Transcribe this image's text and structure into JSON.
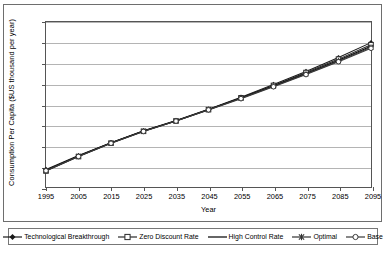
{
  "chart_data": {
    "type": "line",
    "title": "",
    "xlabel": "Year",
    "ylabel": "Consumption Per Capita ($US thousand per year)",
    "x": [
      1995,
      2005,
      2015,
      2025,
      2035,
      2045,
      2055,
      2065,
      2075,
      2085,
      2095
    ],
    "xtick_labels": [
      "1995",
      "2005",
      "2015",
      "2025",
      "2035",
      "2045",
      "2055",
      "2065",
      "2075",
      "2085",
      "2095"
    ],
    "ytick_labels": [
      "-",
      "2.00",
      "4.00",
      "6.00",
      "8.00",
      "10.00",
      "12.00",
      "14.00",
      "16.00"
    ],
    "ytick_values": [
      0,
      2,
      4,
      6,
      8,
      10,
      12,
      14,
      16
    ],
    "xlim": [
      1995,
      2095
    ],
    "ylim": [
      0,
      16
    ],
    "grid": "horizontal",
    "legend_position": "bottom",
    "series": [
      {
        "name": "Technological Breakthrough",
        "marker": "diamond",
        "color": "#1a1a1a",
        "values": [
          1.7,
          3.05,
          4.3,
          5.45,
          6.45,
          7.55,
          8.7,
          9.95,
          11.2,
          12.55,
          14.0
        ]
      },
      {
        "name": "Zero Discount Rate",
        "marker": "square",
        "color": "#2a2a2a",
        "values": [
          1.55,
          2.95,
          4.25,
          5.4,
          6.4,
          7.5,
          8.65,
          9.85,
          11.1,
          12.4,
          13.8
        ]
      },
      {
        "name": "High Control Rate",
        "marker": "none",
        "color": "#000000",
        "values": [
          1.62,
          3.0,
          4.28,
          5.42,
          6.42,
          7.52,
          8.62,
          9.8,
          11.0,
          12.3,
          13.65
        ]
      },
      {
        "name": "Optimal",
        "marker": "cross",
        "color": "#333333",
        "values": [
          1.6,
          2.98,
          4.26,
          5.41,
          6.41,
          7.5,
          8.6,
          9.76,
          10.95,
          12.22,
          13.55
        ]
      },
      {
        "name": "Base",
        "marker": "circle",
        "color": "#3a3a3a",
        "values": [
          1.58,
          2.96,
          4.24,
          5.39,
          6.39,
          7.48,
          8.57,
          9.72,
          10.9,
          12.15,
          13.45
        ]
      }
    ]
  }
}
